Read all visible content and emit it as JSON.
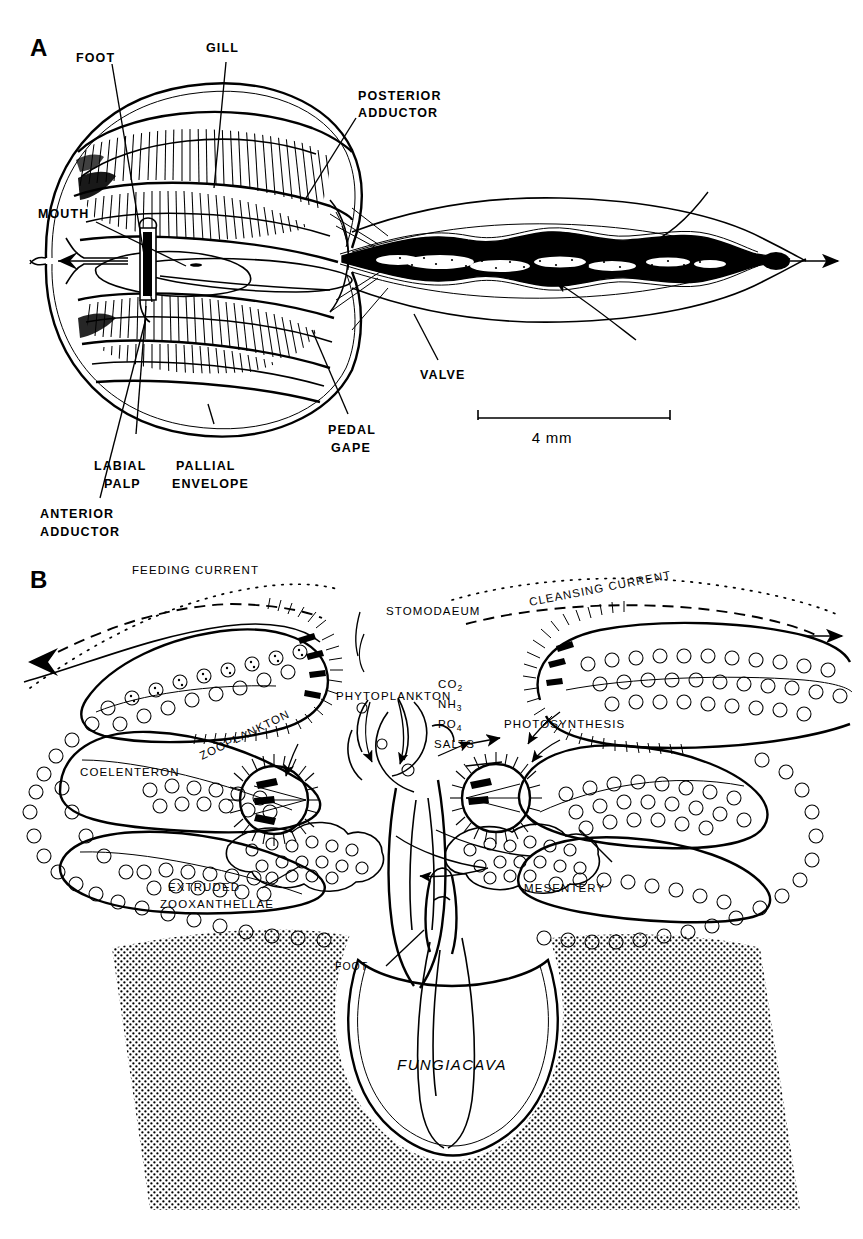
{
  "figure": {
    "background_color": "#ffffff",
    "ink_color": "#000000"
  },
  "panel_a": {
    "letter": "A",
    "scale_bar": {
      "label": "4 mm",
      "length_mm": 4
    },
    "labels": [
      {
        "id": "foot",
        "text": "FOOT"
      },
      {
        "id": "gill",
        "text": "GILL"
      },
      {
        "id": "posterior-adductor",
        "line1": "POSTERIOR",
        "line2": "ADDUCTOR"
      },
      {
        "id": "mouth",
        "text": "MOUTH"
      },
      {
        "id": "valve",
        "text": "VALVE"
      },
      {
        "id": "pedal-gape",
        "line1": "PEDAL",
        "line2": "GAPE"
      },
      {
        "id": "labial-palp",
        "line1": "LABIAL",
        "line2": "PALP"
      },
      {
        "id": "pallial-envelope",
        "line1": "PALLIAL",
        "line2": "ENVELOPE"
      },
      {
        "id": "anterior-adductor",
        "line1": "ANTERIOR",
        "line2": "ADDUCTOR"
      }
    ]
  },
  "panel_b": {
    "letter": "B",
    "labels": [
      {
        "id": "feeding-current",
        "text": "FEEDING CURRENT"
      },
      {
        "id": "cleansing-current",
        "text": "CLEANSING CURRENT"
      },
      {
        "id": "stomodaeum",
        "text": "STOMODAEUM"
      },
      {
        "id": "phytoplankton",
        "text": "PHYTOPLANKTON"
      },
      {
        "id": "zooplankton",
        "text": "ZOOPLANKTON"
      },
      {
        "id": "coelenteron",
        "text": "COELENTERON"
      },
      {
        "id": "photosynthesis",
        "text": "PHOTOSYNTHESIS"
      },
      {
        "id": "extruded-zooxanthellae",
        "line1": "EXTRUDED",
        "line2": "ZOOXANTHELLAE"
      },
      {
        "id": "mesentery",
        "text": "MESENTERY"
      },
      {
        "id": "foot",
        "text": "FOOT"
      },
      {
        "id": "fungiacava",
        "text": "FUNGIACAVA",
        "style": "italic"
      }
    ],
    "nutrients": [
      {
        "id": "co2",
        "base": "CO",
        "sub": "2"
      },
      {
        "id": "nh3",
        "base": "NH",
        "sub": "3"
      },
      {
        "id": "po4",
        "base": "PO",
        "sub": "4"
      },
      {
        "id": "salts",
        "base": "SALTS",
        "sub": ""
      }
    ]
  }
}
